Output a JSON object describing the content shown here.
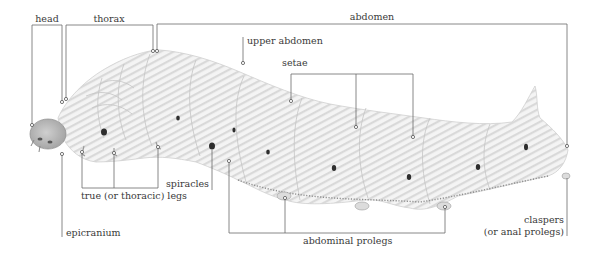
{
  "figure": {
    "labels": {
      "head": "head",
      "thorax": "thorax",
      "abdomen": "abdomen",
      "upper_abdomen": "upper abdomen",
      "setae": "setae",
      "true_legs": "true (or thoracic) legs",
      "spiracles": "spiracles",
      "epicranium": "epicranium",
      "abdominal_prolegs": "abdominal prolegs",
      "claspers_line1": "claspers",
      "claspers_line2": "(or anal prolegs)"
    },
    "colors": {
      "background": "#ffffff",
      "leader_line": "#6a6a6a",
      "label_text": "#3a3a3a",
      "body": "#efefef",
      "head": "#b9b9b9",
      "spiracle": "#2e2e2e"
    }
  }
}
